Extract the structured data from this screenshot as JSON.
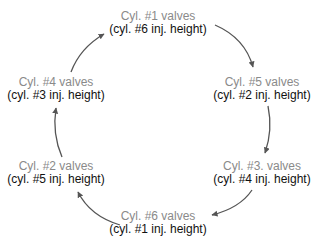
{
  "diagram": {
    "type": "cycle",
    "direction": "clockwise",
    "colors": {
      "valve_text": "#8a8a8a",
      "height_text": "#111111",
      "arrow": "#555555"
    },
    "nodes": [
      {
        "valves": "Cyl. #1 valves",
        "height": "(cyl. #6 inj. height)"
      },
      {
        "valves": "Cyl. #5 valves",
        "height": "(cyl. #2 inj. height)"
      },
      {
        "valves": "Cyl. #3. valves",
        "height": "(cyl. #4 inj. height)"
      },
      {
        "valves": "Cyl. #6 valves",
        "height": "(cyl. #1 inj. height)"
      },
      {
        "valves": "Cyl. #2 valves",
        "height": "(cyl. #5 inj. height)"
      },
      {
        "valves": "Cyl. #4 valves",
        "height": "(cyl. #3 inj. height)"
      }
    ],
    "edges": [
      {
        "from": 0,
        "to": 1
      },
      {
        "from": 1,
        "to": 2
      },
      {
        "from": 2,
        "to": 3
      },
      {
        "from": 3,
        "to": 4
      },
      {
        "from": 4,
        "to": 5
      },
      {
        "from": 5,
        "to": 0
      }
    ]
  }
}
